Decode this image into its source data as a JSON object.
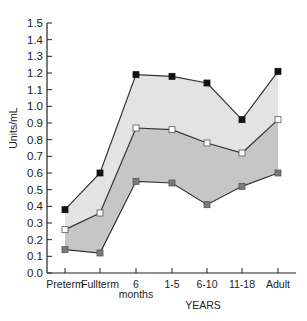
{
  "chart_data": {
    "type": "area",
    "title": "",
    "xlabel": "YEARS",
    "ylabel": "Units/mL",
    "ylim": [
      0,
      1.5
    ],
    "yticks": [
      "0.0",
      "0.1",
      "0.2",
      "0.3",
      "0.4",
      "0.5",
      "0.6",
      "0.7",
      "0.8",
      "0.9",
      "1.0",
      "1.1",
      "1.2",
      "1.3",
      "1.4",
      "1.5"
    ],
    "categories": [
      "Preterm",
      "Fullterm",
      "6 months",
      "1-5",
      "6-10",
      "11-18",
      "Adult"
    ],
    "category_labels": [
      [
        "Preterm"
      ],
      [
        "Fullterm"
      ],
      [
        "6",
        "months"
      ],
      [
        "1-5"
      ],
      [
        "6-10"
      ],
      [
        "11-18"
      ],
      [
        "Adult"
      ]
    ],
    "grid": false,
    "legend": null,
    "series": [
      {
        "name": "upper",
        "marker": "filled-black-square",
        "values": [
          0.38,
          0.6,
          1.19,
          1.18,
          1.14,
          0.92,
          1.21
        ]
      },
      {
        "name": "mean",
        "marker": "open-white-square",
        "values": [
          0.26,
          0.36,
          0.87,
          0.86,
          0.78,
          0.72,
          0.92
        ]
      },
      {
        "name": "lower",
        "marker": "gray-square",
        "values": [
          0.14,
          0.12,
          0.55,
          0.54,
          0.41,
          0.52,
          0.6
        ]
      }
    ],
    "bands": [
      {
        "between": [
          "upper",
          "mean"
        ],
        "color": "#e3e3e3"
      },
      {
        "between": [
          "mean",
          "lower"
        ],
        "color": "#c6c6c6"
      }
    ]
  },
  "colors": {
    "axis": "#222222",
    "line": "#333333",
    "upper_band": "#e3e3e3",
    "lower_band": "#c6c6c6",
    "marker_upper": "#111111",
    "marker_mean": "#ffffff",
    "marker_lower": "#7a7a7a"
  }
}
